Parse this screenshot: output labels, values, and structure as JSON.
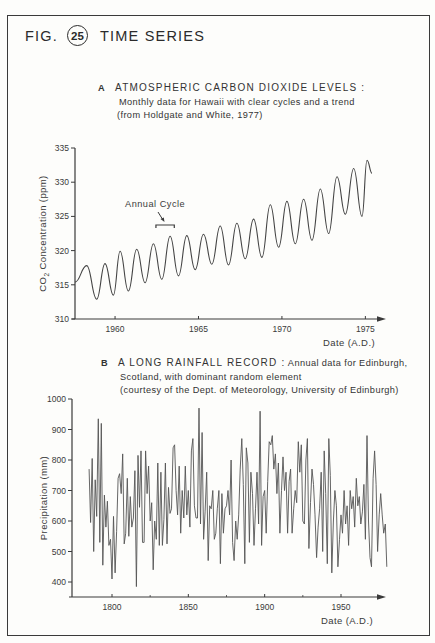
{
  "figure": {
    "label_prefix": "FIG.",
    "number": "25",
    "title": "TIME SERIES"
  },
  "panel_a": {
    "letter": "A",
    "heading": "ATMOSPHERIC CARBON DIOXIDE LEVELS :",
    "line2": "Monthly data for Hawaii with clear cycles and a trend",
    "line3": "(from Holdgate and White, 1977)",
    "annotation": "Annual  Cycle"
  },
  "panel_b": {
    "letter": "B",
    "heading": "A LONG RAINFALL RECORD :",
    "heading_rest": " Annual data for Edinburgh,",
    "line2": "Scotland, with dominant random element",
    "line3": "(courtesy of the Dept. of Meteorology, University of Edinburgh)"
  },
  "chart_data": [
    {
      "type": "line",
      "title": "ATMOSPHERIC CARBON DIOXIDE LEVELS",
      "subtitle": "Monthly data for Hawaii with clear cycles and a trend (from Holdgate and White, 1977)",
      "xlabel": "Date (A.D.)",
      "ylabel": "CO2 Concentration (ppm)",
      "xticks": [
        1960,
        1965,
        1970,
        1975
      ],
      "yticks": [
        310,
        315,
        320,
        325,
        330,
        335
      ],
      "xlim": [
        1957.6,
        1976.2
      ],
      "ylim": [
        310,
        335
      ],
      "grid": false,
      "annotation": "Annual Cycle (bracket spanning ~1962.5-1963.5)",
      "series": [
        {
          "name": "CO2 (ppm), seasonal extremes",
          "x": [
            1957.6,
            1958.3,
            1958.9,
            1959.4,
            1959.9,
            1960.3,
            1960.8,
            1961.3,
            1961.8,
            1962.3,
            1962.8,
            1963.3,
            1963.8,
            1964.3,
            1964.8,
            1965.3,
            1965.8,
            1966.3,
            1966.8,
            1967.3,
            1967.8,
            1968.3,
            1968.8,
            1969.3,
            1969.8,
            1970.3,
            1970.8,
            1971.3,
            1971.8,
            1972.3,
            1972.8,
            1973.3,
            1973.8,
            1974.3,
            1974.8,
            1975.1,
            1975.4
          ],
          "y": [
            315.4,
            317.8,
            312.9,
            318.1,
            313.5,
            319.9,
            314.1,
            320.2,
            315.3,
            321.0,
            315.8,
            322.1,
            316.3,
            322.2,
            317.2,
            322.4,
            318.0,
            323.6,
            317.9,
            324.0,
            318.8,
            324.6,
            319.0,
            326.7,
            320.5,
            327.2,
            321.0,
            327.5,
            321.5,
            329.0,
            322.5,
            330.8,
            325.3,
            332.0,
            325.0,
            333.2,
            331.3
          ]
        }
      ]
    },
    {
      "type": "line",
      "title": "A LONG RAINFALL RECORD",
      "subtitle": "Annual data for Edinburgh, Scotland, with dominant random element (courtesy of the Dept. of Meteorology, University of Edinburgh)",
      "xlabel": "Date (A.D.)",
      "ylabel": "Precipitation (mm)",
      "xticks": [
        1800,
        1850,
        1900,
        1950
      ],
      "yticks": [
        400,
        500,
        600,
        700,
        800,
        900,
        1000
      ],
      "xlim": [
        1775,
        1985
      ],
      "ylim": [
        350,
        1000
      ],
      "grid": false,
      "series": [
        {
          "name": "Annual precipitation (mm)",
          "x_start": 1785,
          "x_step": 1,
          "y": [
            770,
            595,
            805,
            500,
            735,
            615,
            935,
            530,
            920,
            455,
            685,
            580,
            665,
            520,
            540,
            410,
            615,
            430,
            565,
            740,
            755,
            690,
            820,
            525,
            560,
            740,
            550,
            680,
            580,
            610,
            765,
            385,
            815,
            645,
            830,
            530,
            530,
            830,
            690,
            780,
            600,
            660,
            440,
            600,
            540,
            790,
            520,
            760,
            520,
            605,
            790,
            525,
            710,
            625,
            640,
            840,
            850,
            700,
            620,
            780,
            560,
            700,
            610,
            780,
            620,
            700,
            580,
            830,
            870,
            650,
            610,
            610,
            970,
            590,
            890,
            540,
            630,
            760,
            470,
            650,
            640,
            700,
            540,
            560,
            640,
            700,
            460,
            690,
            560,
            640,
            650,
            700,
            620,
            800,
            530,
            470,
            600,
            540,
            620,
            770,
            870,
            720,
            460,
            840,
            790,
            530,
            760,
            690,
            520,
            640,
            760,
            590,
            960,
            520,
            680,
            700,
            560,
            730,
            860,
            850,
            880,
            770,
            820,
            690,
            790,
            560,
            700,
            810,
            700,
            760,
            560,
            730,
            770,
            560,
            640,
            700,
            660,
            860,
            760,
            850,
            600,
            590,
            800,
            870,
            510,
            660,
            770,
            720,
            620,
            480,
            580,
            640,
            760,
            500,
            830,
            690,
            460,
            870,
            750,
            430,
            600,
            700,
            650,
            450,
            540,
            620,
            560,
            700,
            590,
            650,
            520,
            700,
            640,
            680,
            580,
            740,
            650,
            680,
            590,
            630,
            720,
            540,
            880,
            600,
            480,
            450,
            740,
            830,
            720,
            500,
            620,
            690,
            620,
            560,
            590,
            450
          ]
        }
      ]
    }
  ]
}
